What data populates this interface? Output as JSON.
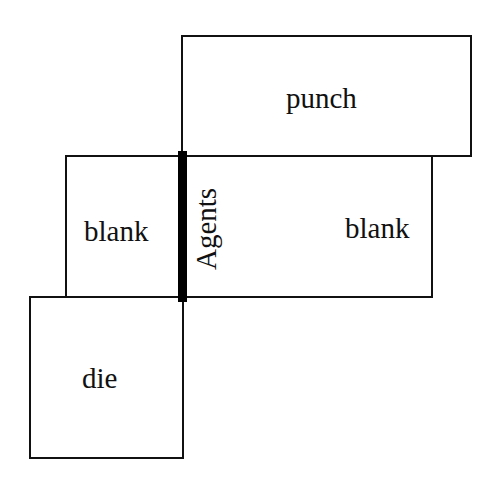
{
  "diagram": {
    "nodes": [
      {
        "id": "punch",
        "label": "punch"
      },
      {
        "id": "blank_left",
        "label": "blank"
      },
      {
        "id": "blank_right",
        "label": "blank"
      },
      {
        "id": "die",
        "label": "die"
      }
    ],
    "interface": {
      "label": "Agents"
    },
    "colors": {
      "stroke": "#111111",
      "interface_bar": "#000000",
      "background": "#ffffff"
    }
  }
}
